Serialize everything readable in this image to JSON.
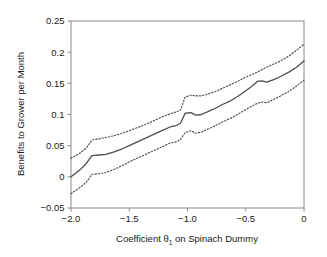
{
  "chart_data": {
    "type": "line",
    "title": "",
    "xlabel": "Coefficient θ₁ on Spinach Dummy",
    "xlabel_main": "Coefficient θ",
    "xlabel_sub": "1",
    "xlabel_tail": " on Spinach Dummy",
    "ylabel": "Benefits to Grower per Month",
    "xlim": [
      -2.0,
      0.0
    ],
    "ylim": [
      -0.05,
      0.25
    ],
    "xticks": [
      -2.0,
      -1.5,
      -1.0,
      -0.5,
      0.0
    ],
    "xticklabels": [
      "−2.0",
      "−1.5",
      "−1.0",
      "−0.5",
      "0"
    ],
    "yticks": [
      -0.05,
      0.0,
      0.05,
      0.1,
      0.15,
      0.2,
      0.25
    ],
    "yticklabels": [
      "−0.05",
      "0",
      "0.05",
      "0.1",
      "0.15",
      "0.2",
      "0.25"
    ],
    "grid": false,
    "legend": "none",
    "line_color": "#4d4d4d",
    "frame_color": "#8a8a8a",
    "background": "#ffffff",
    "x": [
      -2.0,
      -1.93,
      -1.87,
      -1.82,
      -1.76,
      -1.7,
      -1.63,
      -1.56,
      -1.5,
      -1.43,
      -1.36,
      -1.29,
      -1.22,
      -1.15,
      -1.1,
      -1.06,
      -1.02,
      -0.97,
      -0.93,
      -0.88,
      -0.82,
      -0.76,
      -0.7,
      -0.63,
      -0.56,
      -0.5,
      -0.45,
      -0.4,
      -0.36,
      -0.32,
      -0.26,
      -0.2,
      -0.13,
      -0.07,
      0.0
    ],
    "series": [
      {
        "name": "upper confidence bound",
        "style": "dotted",
        "values": [
          0.03,
          0.037,
          0.046,
          0.059,
          0.061,
          0.063,
          0.066,
          0.07,
          0.074,
          0.079,
          0.084,
          0.09,
          0.096,
          0.101,
          0.104,
          0.107,
          0.128,
          0.131,
          0.13,
          0.13,
          0.133,
          0.137,
          0.142,
          0.148,
          0.154,
          0.16,
          0.164,
          0.168,
          0.172,
          0.176,
          0.181,
          0.186,
          0.194,
          0.202,
          0.213
        ]
      },
      {
        "name": "point estimate",
        "style": "solid",
        "values": [
          0.0,
          0.01,
          0.021,
          0.034,
          0.035,
          0.036,
          0.04,
          0.045,
          0.05,
          0.056,
          0.062,
          0.068,
          0.074,
          0.08,
          0.082,
          0.086,
          0.102,
          0.103,
          0.099,
          0.1,
          0.105,
          0.11,
          0.116,
          0.122,
          0.13,
          0.138,
          0.145,
          0.153,
          0.154,
          0.152,
          0.156,
          0.161,
          0.168,
          0.175,
          0.186
        ]
      },
      {
        "name": "lower confidence bound",
        "style": "dotted",
        "values": [
          -0.027,
          -0.018,
          -0.009,
          0.004,
          0.005,
          0.007,
          0.012,
          0.018,
          0.024,
          0.03,
          0.036,
          0.042,
          0.048,
          0.054,
          0.056,
          0.06,
          0.071,
          0.074,
          0.07,
          0.072,
          0.077,
          0.082,
          0.088,
          0.094,
          0.101,
          0.108,
          0.113,
          0.118,
          0.12,
          0.119,
          0.124,
          0.13,
          0.137,
          0.145,
          0.155
        ]
      }
    ]
  }
}
